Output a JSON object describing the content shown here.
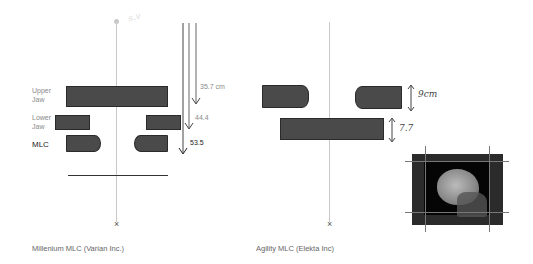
{
  "left_panel": {
    "caption": "Millenium MLC (Varian Inc.)",
    "handwritten_note": "s.v",
    "labels": {
      "upper_jaw_1": "Upper",
      "upper_jaw_2": "Jaw",
      "lower_jaw_1": "Lower",
      "lower_jaw_2": "Jaw",
      "mlc": "MLC"
    },
    "distances": {
      "upper": "35.7 cm",
      "lower": "44.4",
      "mlc": "53.5"
    },
    "isocenter_mark": "×"
  },
  "right_panel": {
    "caption": "Agility MLC (Elekta Inc)",
    "annotations": {
      "mlc_thickness": "9cm",
      "jaw_thickness": "7.7"
    },
    "isocenter_mark": "×",
    "image": "skull-xray-thumbnail"
  },
  "colors": {
    "block": "#4a4a4a",
    "beam_line": "#c8c8c8",
    "arrow": "#555555"
  }
}
